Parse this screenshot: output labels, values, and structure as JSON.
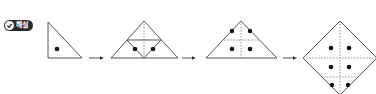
{
  "badge": {
    "label": "해설",
    "icon": "check-circle-icon"
  },
  "colors": {
    "line": "#555555",
    "dot": "#111111",
    "badge_bg": "#2b2b2b"
  },
  "steps": [
    {
      "name": "step-1-folded-triangle",
      "dots": 1
    },
    {
      "name": "step-2-unfold-half",
      "dots": 2
    },
    {
      "name": "step-3-unfold-triangle",
      "dots": 4
    },
    {
      "name": "step-4-unfold-square",
      "dots": 6
    }
  ]
}
